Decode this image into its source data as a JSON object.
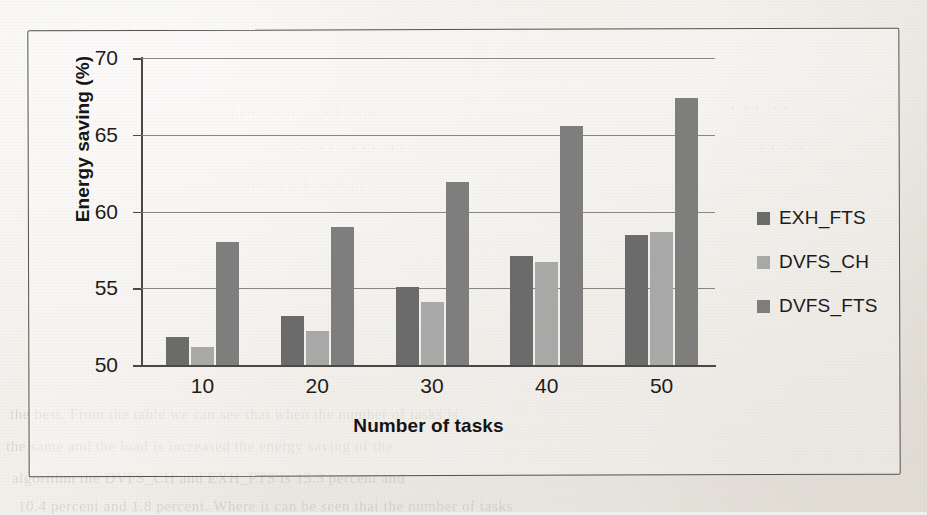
{
  "chart_data": {
    "type": "bar",
    "title": "",
    "subtitle": "",
    "xlabel": "Number of tasks",
    "ylabel": "Energy saving (%)",
    "categories": [
      "10",
      "20",
      "30",
      "40",
      "50"
    ],
    "series": [
      {
        "name": "EXH_FTS",
        "color": "#6b6b6b",
        "values": [
          51.8,
          53.2,
          55.1,
          57.1,
          58.5
        ]
      },
      {
        "name": "DVFS_CH",
        "color": "#a9a9a9",
        "values": [
          51.2,
          52.2,
          54.1,
          56.7,
          58.7
        ]
      },
      {
        "name": "DVFS_FTS",
        "color": "#7e7e7e",
        "values": [
          58.0,
          59.0,
          61.9,
          65.6,
          67.4
        ]
      }
    ],
    "ylim": [
      50,
      70
    ],
    "yticks": [
      50,
      55,
      60,
      65,
      70
    ],
    "ytick_labels": [
      "50",
      "55",
      "60",
      "65",
      "70"
    ],
    "grid": true,
    "grid_axis": "y",
    "legend_position": "right",
    "legend_entries": [
      "EXH_FTS",
      "DVFS_CH",
      "DVFS_FTS"
    ]
  },
  "figure": {
    "frame_border_color": "#55504a",
    "axis_color": "#4c4843",
    "gridline_color": "#77736d",
    "background_color": "#f2f0ec",
    "text_color": "#1d1b19"
  },
  "background_bleed": {
    "note": "faint illegible show-through text from reverse side of scanned page",
    "lines": [
      "the best. From the table we can see that when the number of tasks is",
      "the same and the load is increased the energy saving of the",
      "algorithm the DVFS_CH and EXH_FTS is 15.3 percent and",
      "10.4 percent and 1.8 percent. Where it can be seen that the number of tasks"
    ]
  }
}
